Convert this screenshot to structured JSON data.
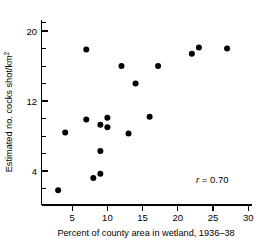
{
  "chart_data": {
    "type": "scatter",
    "title": "",
    "xlabel": "Percent of county area in wetland, 1936–38",
    "ylabel": "Estimated no. cocks shot/km²",
    "ylabel_main": "Estimated no. cocks shot/km",
    "ylabel_exponent": "2",
    "xlim": [
      0,
      30.6
    ],
    "ylim": [
      0,
      21.5
    ],
    "x_ticks": [
      5,
      10,
      15,
      20,
      25,
      30
    ],
    "x_tick_labels": [
      "5",
      "10",
      "15",
      "20",
      "25",
      "30"
    ],
    "y_ticks": [
      4,
      12,
      20
    ],
    "y_tick_labels": [
      "4",
      "12",
      "20"
    ],
    "y_minor_ticks": [
      2,
      6,
      8,
      10,
      14,
      16,
      18,
      21
    ],
    "grid": false,
    "legend": null,
    "marker": "filled-circle",
    "marker_color": "#000000",
    "marker_size": 3.0,
    "points": [
      {
        "x": 3.0,
        "y": 1.8
      },
      {
        "x": 4.0,
        "y": 8.4
      },
      {
        "x": 7.0,
        "y": 17.9
      },
      {
        "x": 7.0,
        "y": 9.9
      },
      {
        "x": 8.0,
        "y": 3.2
      },
      {
        "x": 9.0,
        "y": 3.7
      },
      {
        "x": 9.0,
        "y": 9.3
      },
      {
        "x": 9.0,
        "y": 6.3
      },
      {
        "x": 10.0,
        "y": 10.1
      },
      {
        "x": 10.0,
        "y": 9.0
      },
      {
        "x": 12.0,
        "y": 16.0
      },
      {
        "x": 13.0,
        "y": 8.3
      },
      {
        "x": 14.0,
        "y": 14.0
      },
      {
        "x": 16.0,
        "y": 10.2
      },
      {
        "x": 17.2,
        "y": 16.0
      },
      {
        "x": 22.0,
        "y": 17.4
      },
      {
        "x": 23.0,
        "y": 18.1
      },
      {
        "x": 27.0,
        "y": 18.0
      }
    ],
    "annotations": [
      {
        "name": "correlation",
        "symbol": "r",
        "operator": "=",
        "value": "0.70",
        "text": "r = 0.70",
        "x": 22.5,
        "y": 2.2
      }
    ]
  },
  "axes": {
    "x_axis_name": "x-axis",
    "y_axis_name": "y-axis"
  }
}
